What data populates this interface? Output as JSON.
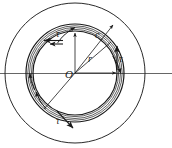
{
  "figure": {
    "type": "engineering-cross-section-diagram",
    "background_color": "#ffffff",
    "line_color": "#1a1a1a",
    "center": {
      "x": 75,
      "y": 73
    },
    "geometry": {
      "outer_circle_radius": 70,
      "tube_outer_radius": 49,
      "tube_mid_radius": 45.5,
      "tube_inner_radius": 42,
      "wall_line_radii": [
        49,
        47.5,
        45.5,
        43.5,
        42
      ]
    },
    "labels": {
      "center_point": "O",
      "radius": "r",
      "centerline_c": "c",
      "shear_stress": "τ"
    },
    "annotations": [
      {
        "name": "center-label",
        "text": "O",
        "x": 67,
        "y": 76
      },
      {
        "name": "radius-label",
        "text": "r",
        "x": 89,
        "y": 61
      },
      {
        "name": "c-label",
        "text": "c",
        "x": 98,
        "y": 36
      },
      {
        "name": "tau-top-left",
        "text": "τ",
        "x": 57,
        "y": 36
      },
      {
        "name": "tau-right",
        "text": "τ",
        "x": 120,
        "y": 59
      },
      {
        "name": "tau-bottom",
        "text": "τ",
        "x": 59,
        "y": 122
      }
    ],
    "shear_arrows": [
      {
        "name": "tau-arrow-top-left",
        "direction": "left",
        "x1": 62,
        "y1": 40,
        "x2": 44,
        "y2": 40
      },
      {
        "name": "tau-arrow-right",
        "direction": "up",
        "x1": 117,
        "y1": 70,
        "x2": 117,
        "y2": 47
      },
      {
        "name": "tau-arrow-bottom",
        "direction": "down-right",
        "x1": 57,
        "y1": 112,
        "x2": 72,
        "y2": 127
      }
    ],
    "curved_flow_arcs": [
      {
        "name": "flow-arc-top",
        "angle_deg": 285
      },
      {
        "name": "flow-arc-right",
        "angle_deg": 10
      },
      {
        "name": "flow-arc-bottom",
        "angle_deg": 160
      }
    ],
    "centerline": {
      "name": "horizontal-axis",
      "x1": 0,
      "y1": 73,
      "x2": 172,
      "y2": 73
    }
  }
}
